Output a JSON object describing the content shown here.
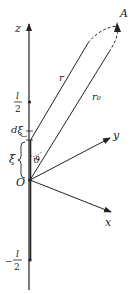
{
  "diagram": {
    "colors": {
      "stroke": "#222222",
      "background": "#ffffff"
    },
    "axes": {
      "z": "z",
      "y": "y",
      "x": "x",
      "origin": "O"
    },
    "point": "A",
    "vectors": {
      "r": "r",
      "r0": "r₀"
    },
    "angle": "ϑ",
    "element": "dξ",
    "coordinate": "ξ",
    "ticks": {
      "top_numerator": "l",
      "top_denominator": "2",
      "bottom_sign": "−",
      "bottom_numerator": "l",
      "bottom_denominator": "2"
    }
  }
}
